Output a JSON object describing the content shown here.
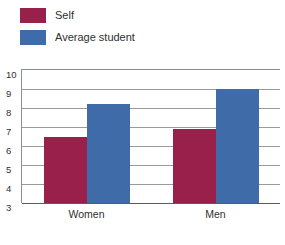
{
  "legend": {
    "items": [
      {
        "label": "Self",
        "color": "#99204a",
        "swatch_name": "legend-swatch-self"
      },
      {
        "label": "Average student",
        "color": "#3f6ca8",
        "swatch_name": "legend-swatch-average-student"
      }
    ]
  },
  "chart_data": {
    "type": "bar",
    "title": "",
    "subtitle": "",
    "xlabel": "",
    "ylabel": "",
    "categories": [
      "Women",
      "Men"
    ],
    "series": [
      {
        "name": "Self",
        "color": "#99204a",
        "values": [
          6.5,
          6.9
        ]
      },
      {
        "name": "Average student",
        "color": "#3f6ca8",
        "values": [
          8.2,
          9.0
        ]
      }
    ],
    "ylim": [
      3,
      10
    ],
    "yticks": [
      10,
      9,
      8,
      7,
      6,
      5,
      4,
      3
    ],
    "ytick_labels": [
      "10",
      "9",
      "8",
      "7",
      "6",
      "5",
      "4",
      "3"
    ],
    "grid": true,
    "legend_position": "top-left"
  }
}
